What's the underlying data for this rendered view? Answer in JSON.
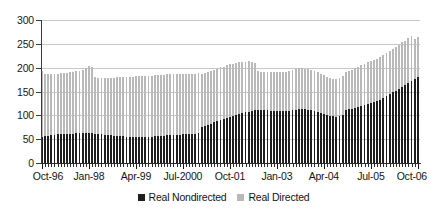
{
  "chart_data": {
    "type": "bar",
    "stacked": true,
    "title": "",
    "subtitle": "",
    "xlabel": "",
    "ylabel": "",
    "ylim": [
      0,
      300
    ],
    "yticks": [
      0,
      50,
      100,
      150,
      200,
      250,
      300
    ],
    "grid": true,
    "legend_position": "bottom",
    "legend": [
      "Real Nondirected",
      "Real Directed"
    ],
    "colors": {
      "real_nondirected": "#1e1e1e",
      "real_directed": "#b9b9b9",
      "gridline": "#c8c8c8",
      "axis": "#2b2b2b",
      "background": "#ffffff",
      "text": "#141414"
    },
    "x_tick_labels": [
      "Oct-96",
      "Jan-98",
      "Apr-99",
      "Jul-2000",
      "Oct-01",
      "Jan-03",
      "Apr-04",
      "Jul-05",
      "Oct-06"
    ],
    "x_tick_indices": [
      0,
      15,
      30,
      45,
      60,
      75,
      90,
      105,
      120
    ],
    "categories": [
      "Oct-96",
      "Nov-96",
      "Dec-96",
      "Jan-97",
      "Feb-97",
      "Mar-97",
      "Apr-97",
      "May-97",
      "Jun-97",
      "Jul-97",
      "Aug-97",
      "Sep-97",
      "Oct-97",
      "Nov-97",
      "Dec-97",
      "Jan-98",
      "Feb-98",
      "Mar-98",
      "Apr-98",
      "May-98",
      "Jun-98",
      "Jul-98",
      "Aug-98",
      "Sep-98",
      "Oct-98",
      "Nov-98",
      "Dec-98",
      "Jan-99",
      "Feb-99",
      "Mar-99",
      "Apr-99",
      "May-99",
      "Jun-99",
      "Jul-99",
      "Aug-99",
      "Sep-99",
      "Oct-99",
      "Nov-99",
      "Dec-99",
      "Jan-2000",
      "Feb-2000",
      "Mar-2000",
      "Apr-2000",
      "May-2000",
      "Jun-2000",
      "Jul-2000",
      "Aug-2000",
      "Sep-2000",
      "Oct-2000",
      "Nov-2000",
      "Dec-2000",
      "Jan-01",
      "Feb-01",
      "Mar-01",
      "Apr-01",
      "May-01",
      "Jun-01",
      "Jul-01",
      "Aug-01",
      "Sep-01",
      "Oct-01",
      "Nov-01",
      "Dec-01",
      "Jan-02",
      "Feb-02",
      "Mar-02",
      "Apr-02",
      "May-02",
      "Jun-02",
      "Jul-02",
      "Aug-02",
      "Sep-02",
      "Oct-02",
      "Nov-02",
      "Dec-02",
      "Jan-03",
      "Feb-03",
      "Mar-03",
      "Apr-03",
      "May-03",
      "Jun-03",
      "Jul-03",
      "Aug-03",
      "Sep-03",
      "Oct-03",
      "Nov-03",
      "Dec-03",
      "Jan-04",
      "Feb-04",
      "Mar-04",
      "Apr-04",
      "May-04",
      "Jun-04",
      "Jul-04",
      "Aug-04",
      "Sep-04",
      "Oct-04",
      "Nov-04",
      "Dec-04",
      "Jan-05",
      "Feb-05",
      "Mar-05",
      "Apr-05",
      "May-05",
      "Jun-05",
      "Jul-05",
      "Aug-05",
      "Sep-05",
      "Oct-05",
      "Nov-05",
      "Dec-05",
      "Jan-06",
      "Feb-06",
      "Mar-06",
      "Apr-06",
      "May-06",
      "Jun-06",
      "Jul-06",
      "Aug-06",
      "Sep-06",
      "Oct-06"
    ],
    "series": [
      {
        "name": "Real Nondirected",
        "color": "#1e1e1e",
        "values": [
          55,
          56,
          57,
          58,
          59,
          60,
          60,
          60,
          61,
          61,
          61,
          62,
          62,
          62,
          62,
          62,
          62,
          61,
          60,
          60,
          59,
          59,
          58,
          57,
          57,
          56,
          56,
          55,
          54,
          54,
          54,
          54,
          54,
          54,
          55,
          55,
          56,
          56,
          57,
          57,
          58,
          58,
          58,
          59,
          59,
          60,
          60,
          60,
          60,
          61,
          62,
          75,
          77,
          80,
          82,
          85,
          88,
          90,
          92,
          95,
          97,
          99,
          101,
          103,
          105,
          106,
          108,
          110,
          111,
          112,
          112,
          112,
          111,
          110,
          110,
          109,
          109,
          109,
          109,
          110,
          111,
          112,
          113,
          113,
          113,
          112,
          111,
          109,
          107,
          105,
          103,
          101,
          99,
          98,
          97,
          98,
          100,
          112,
          113,
          114,
          116,
          118,
          120,
          122,
          124,
          126,
          128,
          130,
          132,
          136,
          140,
          144,
          148,
          152,
          156,
          160,
          164,
          168,
          172,
          176,
          180
        ]
      },
      {
        "name": "Real Directed",
        "color": "#b9b9b9",
        "values": [
          138,
          131,
          130,
          129,
          128,
          127,
          128,
          128,
          128,
          129,
          130,
          131,
          132,
          134,
          138,
          142,
          140,
          119,
          118,
          119,
          120,
          120,
          121,
          122,
          123,
          124,
          125,
          126,
          126,
          127,
          128,
          128,
          129,
          129,
          128,
          128,
          128,
          128,
          127,
          128,
          128,
          129,
          129,
          128,
          127,
          126,
          127,
          127,
          127,
          126,
          127,
          111,
          112,
          112,
          112,
          111,
          110,
          111,
          110,
          111,
          110,
          109,
          108,
          108,
          106,
          106,
          105,
          101,
          99,
          82,
          80,
          79,
          80,
          81,
          81,
          82,
          82,
          82,
          83,
          84,
          84,
          85,
          86,
          86,
          85,
          85,
          85,
          84,
          83,
          82,
          81,
          80,
          79,
          79,
          79,
          80,
          82,
          80,
          81,
          82,
          83,
          84,
          85,
          86,
          87,
          88,
          88,
          89,
          90,
          90,
          90,
          91,
          91,
          92,
          92,
          93,
          93,
          94,
          94,
          84,
          85
        ]
      }
    ],
    "totals_note": "Stacked total ranges from about 190 at Oct-96 to about 265 at Oct-06"
  },
  "legend": {
    "items": [
      {
        "label": "Real Nondirected",
        "swatch": "dark"
      },
      {
        "label": "Real Directed",
        "swatch": "light"
      }
    ]
  }
}
